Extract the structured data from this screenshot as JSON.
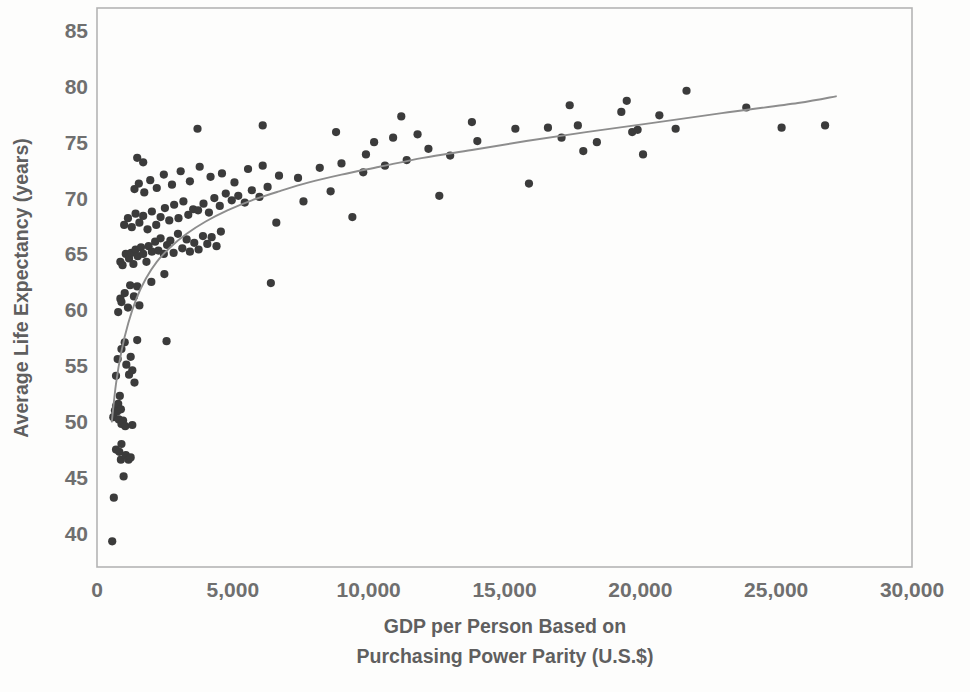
{
  "chart_data": {
    "type": "scatter",
    "title": "",
    "xlabel": "GDP per Person Based on Purchasing Power Parity (U.S.$)",
    "xlabel_line1": "GDP per Person Based on",
    "xlabel_line2": "Purchasing Power Parity (U.S.$)",
    "ylabel": "Average Life Expectancy (years)",
    "xlim": [
      0,
      30000
    ],
    "ylim": [
      37,
      87
    ],
    "xticks": [
      0,
      5000,
      10000,
      15000,
      20000,
      25000,
      30000
    ],
    "xticklabels": [
      "0",
      "5,000",
      "10,000",
      "15,000",
      "20,000",
      "25,000",
      "30,000"
    ],
    "yticks": [
      40,
      45,
      50,
      55,
      60,
      65,
      70,
      75,
      80,
      85
    ],
    "yticklabels": [
      "40",
      "45",
      "50",
      "55",
      "60",
      "65",
      "70",
      "75",
      "80",
      "85"
    ],
    "grid": false,
    "legend": null,
    "marker_color": "#3b3b3b",
    "curve_color": "#8d8d8d",
    "frame_color": "#b4b4b4",
    "background_color": "#fdfdfc",
    "series": [
      {
        "name": "Countries",
        "marker": "circle",
        "points": [
          [
            560,
            39.3
          ],
          [
            620,
            43.2
          ],
          [
            700,
            47.5
          ],
          [
            820,
            47.3
          ],
          [
            880,
            46.6
          ],
          [
            900,
            48.0
          ],
          [
            980,
            45.1
          ],
          [
            1060,
            47.0
          ],
          [
            1160,
            46.6
          ],
          [
            1240,
            46.8
          ],
          [
            600,
            50.4
          ],
          [
            660,
            51.0
          ],
          [
            700,
            51.4
          ],
          [
            740,
            50.9
          ],
          [
            780,
            51.6
          ],
          [
            800,
            50.2
          ],
          [
            840,
            52.3
          ],
          [
            880,
            51.1
          ],
          [
            900,
            49.8
          ],
          [
            960,
            50.1
          ],
          [
            1040,
            49.6
          ],
          [
            1300,
            49.7
          ],
          [
            700,
            54.1
          ],
          [
            760,
            55.6
          ],
          [
            900,
            56.5
          ],
          [
            1020,
            57.1
          ],
          [
            1080,
            55.1
          ],
          [
            1180,
            54.2
          ],
          [
            1240,
            55.8
          ],
          [
            1300,
            54.6
          ],
          [
            1380,
            53.5
          ],
          [
            1480,
            57.3
          ],
          [
            2560,
            57.2
          ],
          [
            780,
            59.8
          ],
          [
            860,
            61.0
          ],
          [
            900,
            60.7
          ],
          [
            1020,
            61.5
          ],
          [
            1140,
            60.2
          ],
          [
            1220,
            62.2
          ],
          [
            1360,
            61.2
          ],
          [
            1480,
            62.1
          ],
          [
            1560,
            60.4
          ],
          [
            2000,
            62.5
          ],
          [
            2480,
            63.2
          ],
          [
            6400,
            62.4
          ],
          [
            860,
            64.3
          ],
          [
            940,
            64.0
          ],
          [
            1060,
            65.0
          ],
          [
            1180,
            64.6
          ],
          [
            1260,
            65.1
          ],
          [
            1340,
            64.1
          ],
          [
            1420,
            65.4
          ],
          [
            1500,
            64.8
          ],
          [
            1620,
            65.6
          ],
          [
            1700,
            65.0
          ],
          [
            1820,
            64.3
          ],
          [
            1900,
            65.7
          ],
          [
            2020,
            65.2
          ],
          [
            2140,
            66.1
          ],
          [
            2260,
            65.3
          ],
          [
            2340,
            66.4
          ],
          [
            2460,
            65.0
          ],
          [
            2580,
            65.8
          ],
          [
            2700,
            66.2
          ],
          [
            2820,
            65.1
          ],
          [
            2980,
            66.8
          ],
          [
            3140,
            65.5
          ],
          [
            3300,
            66.3
          ],
          [
            3420,
            65.2
          ],
          [
            3580,
            66.0
          ],
          [
            3740,
            65.4
          ],
          [
            3900,
            66.6
          ],
          [
            4060,
            65.9
          ],
          [
            4220,
            66.5
          ],
          [
            4400,
            65.7
          ],
          [
            4560,
            67.0
          ],
          [
            1000,
            67.6
          ],
          [
            1140,
            68.2
          ],
          [
            1280,
            67.4
          ],
          [
            1420,
            68.6
          ],
          [
            1560,
            67.8
          ],
          [
            1700,
            68.4
          ],
          [
            1860,
            67.2
          ],
          [
            2020,
            68.8
          ],
          [
            2180,
            67.6
          ],
          [
            2340,
            68.3
          ],
          [
            2500,
            69.1
          ],
          [
            2660,
            68.0
          ],
          [
            2840,
            69.4
          ],
          [
            3000,
            68.2
          ],
          [
            3180,
            69.7
          ],
          [
            3360,
            68.5
          ],
          [
            3540,
            69.0
          ],
          [
            3720,
            68.9
          ],
          [
            3920,
            69.5
          ],
          [
            4120,
            68.7
          ],
          [
            4320,
            70.0
          ],
          [
            4520,
            69.3
          ],
          [
            4740,
            70.4
          ],
          [
            4960,
            69.8
          ],
          [
            5200,
            70.2
          ],
          [
            5440,
            69.6
          ],
          [
            5700,
            70.7
          ],
          [
            5980,
            70.1
          ],
          [
            6280,
            71.0
          ],
          [
            6600,
            67.8
          ],
          [
            1380,
            70.8
          ],
          [
            1540,
            71.3
          ],
          [
            1740,
            70.5
          ],
          [
            1960,
            71.6
          ],
          [
            2200,
            70.9
          ],
          [
            2460,
            72.1
          ],
          [
            2760,
            71.2
          ],
          [
            3080,
            72.4
          ],
          [
            3420,
            71.5
          ],
          [
            3780,
            72.8
          ],
          [
            4180,
            71.9
          ],
          [
            4600,
            72.2
          ],
          [
            5060,
            71.4
          ],
          [
            5560,
            72.6
          ],
          [
            6100,
            72.9
          ],
          [
            6700,
            72.0
          ],
          [
            7400,
            71.8
          ],
          [
            8200,
            72.7
          ],
          [
            9000,
            73.1
          ],
          [
            9800,
            72.3
          ],
          [
            10600,
            72.9
          ],
          [
            11400,
            73.4
          ],
          [
            12200,
            74.4
          ],
          [
            13000,
            73.8
          ],
          [
            1480,
            73.6
          ],
          [
            1700,
            73.2
          ],
          [
            3700,
            76.2
          ],
          [
            6100,
            76.5
          ],
          [
            8800,
            75.9
          ],
          [
            10200,
            75.0
          ],
          [
            10900,
            75.4
          ],
          [
            11200,
            77.3
          ],
          [
            11800,
            75.7
          ],
          [
            13800,
            76.8
          ],
          [
            14000,
            75.1
          ],
          [
            15400,
            76.2
          ],
          [
            15900,
            71.3
          ],
          [
            16600,
            76.3
          ],
          [
            17100,
            75.4
          ],
          [
            17400,
            78.3
          ],
          [
            17700,
            76.5
          ],
          [
            17900,
            74.2
          ],
          [
            18400,
            75.0
          ],
          [
            19300,
            77.7
          ],
          [
            19500,
            78.7
          ],
          [
            19700,
            75.9
          ],
          [
            19900,
            76.1
          ],
          [
            20100,
            73.9
          ],
          [
            20700,
            77.4
          ],
          [
            21300,
            76.2
          ],
          [
            21700,
            79.6
          ],
          [
            23900,
            78.1
          ],
          [
            25200,
            76.3
          ],
          [
            26800,
            76.5
          ],
          [
            9400,
            68.3
          ],
          [
            7600,
            69.7
          ],
          [
            8600,
            70.6
          ],
          [
            12600,
            70.2
          ],
          [
            9900,
            73.9
          ]
        ]
      }
    ],
    "fit_curve": {
      "name": "Logarithmic trend",
      "description": "Smooth increasing logarithmic-shaped fit line",
      "points": [
        [
          545,
          50.0
        ],
        [
          700,
          53.4
        ],
        [
          900,
          56.3
        ],
        [
          1150,
          58.8
        ],
        [
          1450,
          61.0
        ],
        [
          1800,
          62.8
        ],
        [
          2200,
          64.3
        ],
        [
          2700,
          65.6
        ],
        [
          3300,
          66.8
        ],
        [
          4000,
          67.9
        ],
        [
          4800,
          68.9
        ],
        [
          5700,
          69.8
        ],
        [
          6700,
          70.6
        ],
        [
          7800,
          71.4
        ],
        [
          9000,
          72.1
        ],
        [
          10400,
          72.8
        ],
        [
          12000,
          73.6
        ],
        [
          13800,
          74.3
        ],
        [
          15800,
          75.1
        ],
        [
          18000,
          75.9
        ],
        [
          20400,
          76.7
        ],
        [
          23000,
          77.6
        ],
        [
          25800,
          78.5
        ],
        [
          27200,
          79.1
        ]
      ]
    }
  }
}
